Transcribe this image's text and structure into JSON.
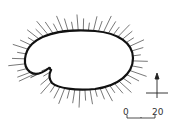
{
  "diagram": {
    "type": "outline-with-radial-spikes",
    "outline_color": "#111111",
    "spike_color": "#555555",
    "scale_bar": {
      "start_label": "0",
      "end_label": "20"
    },
    "orientation_marker": {
      "arrow": "north-up-cross"
    }
  }
}
